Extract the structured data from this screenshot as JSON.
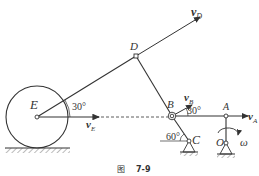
{
  "figure": {
    "caption_prefix": "图",
    "caption_number": "7-9"
  },
  "points": {
    "E": "E",
    "D": "D",
    "B": "B",
    "A": "A",
    "C": "C",
    "O": "O"
  },
  "vectors": {
    "vD": {
      "base": "v",
      "sub": "D"
    },
    "vE": {
      "base": "v",
      "sub": "E"
    },
    "vB": {
      "base": "v",
      "sub": "B"
    },
    "vA": {
      "base": "v",
      "sub": "A"
    }
  },
  "angles": {
    "at_E": "30°",
    "at_B": "30°",
    "at_C": "60°"
  },
  "omega": "ω",
  "colors": {
    "line": "#333333",
    "background": "#ffffff"
  }
}
